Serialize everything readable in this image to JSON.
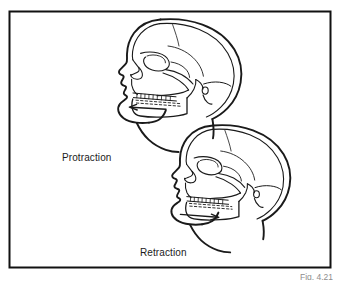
{
  "figure": {
    "type": "anatomical-line-drawing",
    "caption": "Fig. 4.21",
    "border_color": "#111111",
    "background_color": "#ffffff",
    "line_color": "#1a1a1a",
    "labels": [
      {
        "id": "protraction",
        "text": "Protraction"
      },
      {
        "id": "retraction",
        "text": "Retraction"
      }
    ],
    "arrows": [
      {
        "id": "protraction-arrow",
        "direction": "left",
        "meaning": "mandible moves forward"
      },
      {
        "id": "retraction-arrow",
        "direction": "right",
        "meaning": "mandible moves backward"
      }
    ],
    "skulls": [
      {
        "id": "upper-skull",
        "position": "upper-center",
        "label": "Protraction"
      },
      {
        "id": "lower-skull",
        "position": "lower-right",
        "label": "Retraction"
      }
    ]
  }
}
